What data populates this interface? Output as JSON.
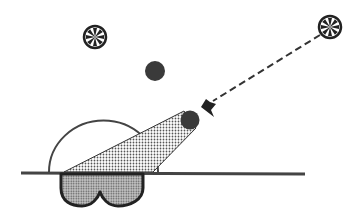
{
  "diagram": {
    "colors": {
      "background": "#ffffff",
      "stroke": "#333333",
      "ball": "#3a3a3a",
      "goggles_fill": "#9a9a9a",
      "cone_dot": "#555555"
    },
    "elements": [
      {
        "id": "star-left",
        "type": "star-icon"
      },
      {
        "id": "star-right",
        "type": "star-icon"
      },
      {
        "id": "dark-ball",
        "type": "filled-circle"
      },
      {
        "id": "light-ray",
        "type": "dashed-arrow"
      },
      {
        "id": "view-cone",
        "type": "dotted-cone"
      },
      {
        "id": "sky-dome",
        "type": "semicircle"
      },
      {
        "id": "horizon",
        "type": "line"
      },
      {
        "id": "goggles",
        "type": "goggles-shape"
      }
    ]
  }
}
